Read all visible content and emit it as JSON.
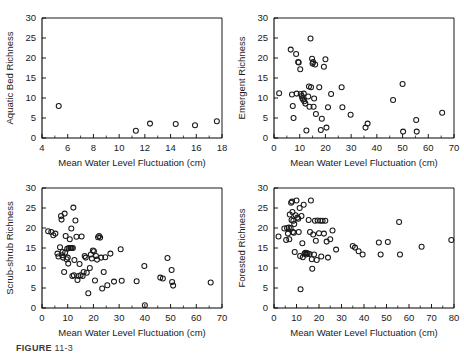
{
  "figure": {
    "caption_label": "FIGURE",
    "caption_rest": " 11-3",
    "shared_xlabel": "Mean Water Level Fluctuation (cm)",
    "marker_style": "open-circle",
    "marker_color": "#1a1a1a",
    "background": "#ffffff"
  },
  "chart_data": [
    {
      "id": "aquatic-bed",
      "type": "scatter",
      "title": "",
      "xlabel": "Mean Water Level Fluctuation (cm)",
      "ylabel": "Aquatic Bed Richness",
      "xlim": [
        4,
        18
      ],
      "ylim": [
        0,
        30
      ],
      "xticks": [
        4,
        6,
        8,
        10,
        12,
        14,
        16,
        18
      ],
      "yticks": [
        0,
        5,
        10,
        15,
        20,
        25,
        30
      ],
      "grid": false,
      "legend": "none",
      "points": [
        [
          5.3,
          8.0
        ],
        [
          11.3,
          1.8
        ],
        [
          12.4,
          3.6
        ],
        [
          14.4,
          3.5
        ],
        [
          15.9,
          3.2
        ],
        [
          17.6,
          4.2
        ]
      ]
    },
    {
      "id": "emergent",
      "type": "scatter",
      "title": "",
      "xlabel": "Mean Water Level Fluctuation (cm)",
      "ylabel": "Emergent Richness",
      "xlim": [
        0,
        70
      ],
      "ylim": [
        0,
        30
      ],
      "xticks": [
        0,
        10,
        20,
        30,
        40,
        50,
        60,
        70
      ],
      "yticks": [
        0,
        5,
        10,
        15,
        20,
        25,
        30
      ],
      "grid": false,
      "legend": "none",
      "points": [
        [
          2.0,
          11.2
        ],
        [
          6.5,
          22.1
        ],
        [
          7.0,
          10.9
        ],
        [
          7.3,
          8.0
        ],
        [
          7.6,
          5.0
        ],
        [
          8.6,
          21.0
        ],
        [
          8.8,
          11.1
        ],
        [
          9.4,
          19.0
        ],
        [
          9.6,
          18.9
        ],
        [
          10.2,
          17.2
        ],
        [
          10.4,
          11.0
        ],
        [
          10.8,
          10.5
        ],
        [
          11.0,
          10.0
        ],
        [
          11.3,
          9.6
        ],
        [
          11.6,
          11.1
        ],
        [
          11.8,
          9.2
        ],
        [
          12.2,
          8.6
        ],
        [
          12.6,
          1.9
        ],
        [
          13.3,
          10.4
        ],
        [
          13.6,
          12.9
        ],
        [
          13.8,
          7.8
        ],
        [
          14.2,
          24.9
        ],
        [
          14.4,
          12.7
        ],
        [
          14.8,
          19.8
        ],
        [
          15.0,
          18.6
        ],
        [
          15.2,
          19.0
        ],
        [
          15.4,
          7.8
        ],
        [
          15.6,
          9.9
        ],
        [
          16.0,
          18.4
        ],
        [
          16.3,
          6.0
        ],
        [
          17.6,
          12.7
        ],
        [
          18.2,
          2.0
        ],
        [
          18.6,
          4.8
        ],
        [
          19.4,
          17.8
        ],
        [
          20.0,
          19.7
        ],
        [
          20.4,
          2.6
        ],
        [
          21.0,
          7.7
        ],
        [
          22.2,
          11.0
        ],
        [
          26.3,
          12.7
        ],
        [
          26.6,
          7.7
        ],
        [
          29.8,
          5.8
        ],
        [
          35.6,
          2.6
        ],
        [
          36.4,
          3.6
        ],
        [
          46.3,
          9.5
        ],
        [
          50.0,
          13.5
        ],
        [
          50.2,
          1.6
        ],
        [
          55.3,
          4.5
        ],
        [
          55.5,
          1.6
        ],
        [
          65.4,
          6.3
        ]
      ]
    },
    {
      "id": "scrub-shrub",
      "type": "scatter",
      "title": "",
      "xlabel": "Mean Water Level Fluctuation (cm)",
      "ylabel": "Scrub-shrub Richness",
      "xlim": [
        0,
        70
      ],
      "ylim": [
        0,
        30
      ],
      "xticks": [
        0,
        10,
        20,
        30,
        40,
        50,
        60,
        70
      ],
      "yticks": [
        0,
        5,
        10,
        15,
        20,
        25,
        30
      ],
      "grid": false,
      "legend": "none",
      "points": [
        [
          2.4,
          19.2
        ],
        [
          3.6,
          19.0
        ],
        [
          4.4,
          18.2
        ],
        [
          5.2,
          18.6
        ],
        [
          6.0,
          13.6
        ],
        [
          6.4,
          12.9
        ],
        [
          7.0,
          15.2
        ],
        [
          7.4,
          23.0
        ],
        [
          7.6,
          22.1
        ],
        [
          7.8,
          13.2
        ],
        [
          8.0,
          14.0
        ],
        [
          8.2,
          12.6
        ],
        [
          8.6,
          9.0
        ],
        [
          8.8,
          23.6
        ],
        [
          9.0,
          13.9
        ],
        [
          9.2,
          18.0
        ],
        [
          9.6,
          12.2
        ],
        [
          9.8,
          14.8
        ],
        [
          10.0,
          12.6
        ],
        [
          10.2,
          11.1
        ],
        [
          10.4,
          15.0
        ],
        [
          10.8,
          17.2
        ],
        [
          11.0,
          15.0
        ],
        [
          11.2,
          15.0
        ],
        [
          11.4,
          19.9
        ],
        [
          11.6,
          15.0
        ],
        [
          11.8,
          8.0
        ],
        [
          12.0,
          15.0
        ],
        [
          12.2,
          25.1
        ],
        [
          12.4,
          8.2
        ],
        [
          12.6,
          12.0
        ],
        [
          13.0,
          21.9
        ],
        [
          13.4,
          17.8
        ],
        [
          13.8,
          7.0
        ],
        [
          14.2,
          8.0
        ],
        [
          14.6,
          11.0
        ],
        [
          15.0,
          8.2
        ],
        [
          15.4,
          17.9
        ],
        [
          15.8,
          8.0
        ],
        [
          16.2,
          9.0
        ],
        [
          16.6,
          13.0
        ],
        [
          17.0,
          12.6
        ],
        [
          17.4,
          8.8
        ],
        [
          18.0,
          3.7
        ],
        [
          18.6,
          10.0
        ],
        [
          19.0,
          13.4
        ],
        [
          19.4,
          12.4
        ],
        [
          19.8,
          14.4
        ],
        [
          20.2,
          14.2
        ],
        [
          20.6,
          6.9
        ],
        [
          21.0,
          13.0
        ],
        [
          21.4,
          12.1
        ],
        [
          21.8,
          17.7
        ],
        [
          22.2,
          18.0
        ],
        [
          22.6,
          17.6
        ],
        [
          23.0,
          12.6
        ],
        [
          23.4,
          4.9
        ],
        [
          24.0,
          9.0
        ],
        [
          24.6,
          12.7
        ],
        [
          25.4,
          5.7
        ],
        [
          26.6,
          13.6
        ],
        [
          28.0,
          6.6
        ],
        [
          30.6,
          14.7
        ],
        [
          31.0,
          6.8
        ],
        [
          36.8,
          6.7
        ],
        [
          39.8,
          10.5
        ],
        [
          40.0,
          0.7
        ],
        [
          46.0,
          7.6
        ],
        [
          47.0,
          7.4
        ],
        [
          48.8,
          12.5
        ],
        [
          50.4,
          9.5
        ],
        [
          50.6,
          6.5
        ],
        [
          51.0,
          5.6
        ],
        [
          65.6,
          6.4
        ]
      ]
    },
    {
      "id": "forested",
      "type": "scatter",
      "title": "",
      "xlabel": "Mean Water Level Fluctuation (cm)",
      "ylabel": "Forested Richness",
      "xlim": [
        0,
        80
      ],
      "ylim": [
        0,
        30
      ],
      "xticks": [
        0,
        10,
        20,
        30,
        40,
        50,
        60,
        70,
        80
      ],
      "yticks": [
        0,
        5,
        10,
        15,
        20,
        25,
        30
      ],
      "grid": false,
      "legend": "none",
      "points": [
        [
          2.0,
          17.9
        ],
        [
          4.6,
          19.9
        ],
        [
          5.4,
          17.0
        ],
        [
          5.8,
          20.0
        ],
        [
          6.2,
          18.6
        ],
        [
          6.6,
          20.1
        ],
        [
          6.8,
          17.2
        ],
        [
          7.0,
          23.4
        ],
        [
          7.4,
          20.0
        ],
        [
          7.6,
          26.3
        ],
        [
          7.8,
          22.0
        ],
        [
          8.0,
          26.6
        ],
        [
          8.2,
          24.0
        ],
        [
          8.4,
          19.0
        ],
        [
          8.6,
          21.8
        ],
        [
          8.8,
          18.8
        ],
        [
          9.0,
          21.0
        ],
        [
          9.2,
          14.0
        ],
        [
          9.6,
          23.2
        ],
        [
          10.0,
          26.9
        ],
        [
          10.4,
          22.6
        ],
        [
          10.8,
          22.3
        ],
        [
          11.0,
          19.0
        ],
        [
          11.4,
          25.0
        ],
        [
          11.6,
          13.0
        ],
        [
          11.8,
          4.7
        ],
        [
          12.2,
          23.0
        ],
        [
          12.6,
          16.2
        ],
        [
          12.8,
          12.7
        ],
        [
          13.2,
          25.8
        ],
        [
          13.6,
          13.6
        ],
        [
          14.0,
          13.8
        ],
        [
          14.2,
          13.4
        ],
        [
          14.6,
          13.7
        ],
        [
          15.0,
          13.6
        ],
        [
          15.4,
          22.0
        ],
        [
          15.8,
          13.5
        ],
        [
          16.0,
          19.0
        ],
        [
          16.4,
          26.9
        ],
        [
          16.8,
          12.2
        ],
        [
          17.0,
          9.8
        ],
        [
          17.4,
          18.4
        ],
        [
          17.8,
          13.4
        ],
        [
          18.2,
          21.8
        ],
        [
          18.6,
          16.8
        ],
        [
          19.0,
          12.0
        ],
        [
          19.4,
          21.9
        ],
        [
          20.0,
          18.7
        ],
        [
          20.6,
          21.8
        ],
        [
          21.0,
          12.9
        ],
        [
          21.6,
          21.8
        ],
        [
          22.2,
          18.6
        ],
        [
          22.8,
          21.8
        ],
        [
          23.4,
          16.6
        ],
        [
          24.0,
          12.6
        ],
        [
          25.0,
          17.2
        ],
        [
          26.0,
          19.4
        ],
        [
          27.6,
          14.6
        ],
        [
          35.0,
          15.5
        ],
        [
          36.0,
          15.1
        ],
        [
          37.6,
          14.2
        ],
        [
          39.4,
          13.4
        ],
        [
          46.6,
          16.4
        ],
        [
          47.4,
          13.4
        ],
        [
          50.6,
          16.5
        ],
        [
          55.6,
          21.5
        ],
        [
          56.0,
          13.4
        ],
        [
          65.6,
          15.3
        ],
        [
          78.8,
          17.0
        ]
      ]
    }
  ]
}
